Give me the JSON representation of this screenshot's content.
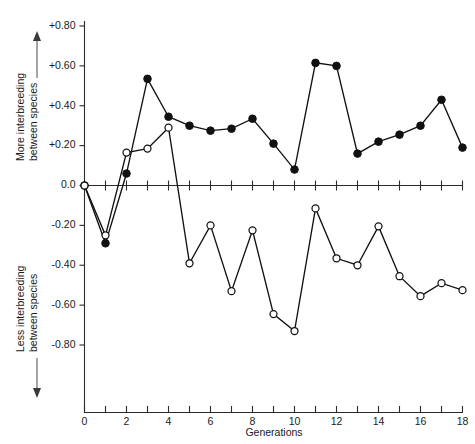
{
  "chart_data": {
    "type": "line",
    "title": "",
    "xlabel": "Generations",
    "ylabel": "",
    "xlim": [
      0,
      18
    ],
    "ylim": [
      -0.8,
      0.8
    ],
    "grid": false,
    "legend_position": "none",
    "x_ticks": [
      0,
      1,
      2,
      3,
      4,
      5,
      6,
      7,
      8,
      9,
      10,
      11,
      12,
      13,
      14,
      15,
      16,
      17,
      18
    ],
    "x_tick_labels": [
      "0",
      "",
      "2",
      "",
      "4",
      "",
      "6",
      "",
      "8",
      "",
      "10",
      "",
      "12",
      "",
      "14",
      "",
      "16",
      "",
      "18"
    ],
    "y_ticks": [
      0.8,
      0.6,
      0.4,
      0.2,
      0.0,
      -0.2,
      -0.4,
      -0.6,
      -0.8
    ],
    "y_tick_labels": [
      "+0.80",
      "+0.60",
      "+0.40",
      "+0.20",
      "0.0",
      "-0.20",
      "-0.40",
      "-0.60",
      "-0.80"
    ],
    "x": [
      0,
      1,
      2,
      3,
      4,
      5,
      6,
      7,
      8,
      9,
      10,
      11,
      12,
      13,
      14,
      15,
      16,
      17,
      18
    ],
    "series": [
      {
        "name": "filled-circles-series",
        "marker": "filled-circle",
        "values": [
          0.0,
          -0.29,
          0.06,
          0.535,
          0.345,
          0.3,
          0.275,
          0.285,
          0.335,
          0.21,
          0.08,
          0.615,
          0.6,
          0.16,
          0.22,
          0.255,
          0.3,
          0.43,
          0.19
        ]
      },
      {
        "name": "open-circles-series",
        "marker": "open-circle",
        "values": [
          0.0,
          -0.25,
          0.165,
          0.185,
          0.29,
          -0.39,
          -0.2,
          -0.53,
          -0.225,
          -0.645,
          -0.73,
          -0.115,
          -0.365,
          -0.4,
          -0.205,
          -0.455,
          -0.555,
          -0.49,
          -0.525
        ]
      }
    ],
    "annotations": {
      "upper_axis_label": "More interbreeding between species",
      "upper_axis_label_lines": [
        "More interbreeding",
        "between species"
      ],
      "upper_arrow_direction": "up",
      "lower_axis_label": "Less interbreeding between species",
      "lower_axis_label_lines": [
        "Less interbreeding",
        "between species"
      ],
      "lower_arrow_direction": "down"
    }
  },
  "axis": {
    "x_title": "Generations"
  },
  "labels": {
    "upper_line1": "More interbreeding",
    "upper_line2": "between species",
    "lower_line1": "Less interbreeding",
    "lower_line2": "between species"
  },
  "colors": {
    "line": "#111111",
    "axis": "#2b2b2b",
    "background": "#ffffff",
    "marker_open_fill": "#ffffff"
  }
}
